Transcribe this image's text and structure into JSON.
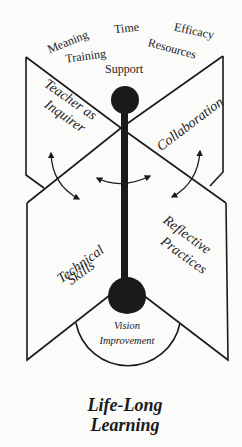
{
  "diagram": {
    "type": "butterfly-model",
    "factors": {
      "meaning": "Meaning",
      "time": "Time",
      "efficacy": "Efficacy",
      "training": "Training",
      "resources": "Resources",
      "support": "Support"
    },
    "wings": {
      "top_left": "Teacher as Inquirer",
      "top_left_line1": "Teacher as",
      "top_left_line2": "Inquirer",
      "top_right": "Collaboration",
      "bottom_left_line1": "Technical",
      "bottom_left_line2": "Skills",
      "bottom_right_line1": "Reflective",
      "bottom_right_line2": "Practices"
    },
    "base": {
      "line1": "Vision",
      "line2": "Improvement"
    },
    "caption": {
      "line1": "Life-Long",
      "line2": "Learning"
    },
    "colors": {
      "ink": "#1a1a1a",
      "background": "#fbfbfa"
    }
  }
}
